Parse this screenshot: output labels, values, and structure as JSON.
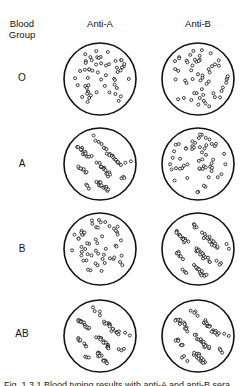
{
  "header": {
    "row_header": "Blood Group",
    "row_header_line1": "Blood",
    "row_header_line2": "Group",
    "columns": [
      "Anti-A",
      "Anti-B"
    ]
  },
  "rows": [
    {
      "label": "O",
      "anti_a": "no agglutination",
      "anti_b": "no agglutination"
    },
    {
      "label": "A",
      "anti_a": "agglutination",
      "anti_b": "no agglutination"
    },
    {
      "label": "B",
      "anti_a": "no agglutination",
      "anti_b": "agglutination"
    },
    {
      "label": "AB",
      "anti_a": "agglutination",
      "anti_b": "agglutination"
    }
  ],
  "caption": "Fig. 1.3.1  Blood typing results with anti-A and anti-B sera",
  "colors": {
    "stroke": "#111111",
    "background": "#ffffff"
  }
}
